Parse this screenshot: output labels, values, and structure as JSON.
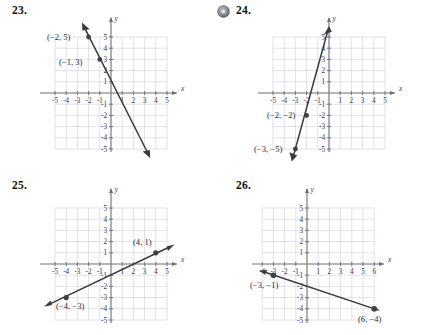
{
  "page": {
    "background_color": "#ffffff",
    "grid_color": "#c9cfdd",
    "axis_color": "#6e6e72",
    "line_color": "#3a3a40"
  },
  "problems": [
    {
      "id": "23",
      "number_label": "23.",
      "has_disc_icon": false,
      "axis": {
        "x_label": "x",
        "y_label": "y",
        "x_ticks": [
          "-5",
          "-4",
          "-3",
          "-2",
          "-1",
          "1",
          "2",
          "3",
          "4",
          "5"
        ],
        "y_ticks": [
          "5",
          "4",
          "3",
          "2",
          "1",
          "-1",
          "-2",
          "-3",
          "-4",
          "-5"
        ],
        "x_min": -5,
        "x_max": 5,
        "y_min": -5,
        "y_max": 5
      },
      "points": [
        {
          "label": "(−2, 5)",
          "x": -2,
          "y": 5
        },
        {
          "label": "(−1, 3)",
          "x": -1,
          "y": 3
        }
      ],
      "line": {
        "from_x": -2.45,
        "from_y": 6.0,
        "to_x": 3.35,
        "to_y": -5.5,
        "slope": -2,
        "intercept": 1
      }
    },
    {
      "id": "24",
      "number_label": "24.",
      "has_disc_icon": true,
      "disc_icon_name": "cd-disc-icon",
      "axis": {
        "x_label": "x",
        "y_label": "y",
        "x_ticks": [
          "-5",
          "-4",
          "-3",
          "-2",
          "-1",
          "1",
          "2",
          "3",
          "4",
          "5"
        ],
        "y_ticks": [
          "5",
          "4",
          "3",
          "2",
          "1",
          "-1",
          "-2",
          "-3",
          "-4",
          "-5"
        ],
        "x_min": -5,
        "x_max": 5,
        "y_min": -5,
        "y_max": 5
      },
      "points": [
        {
          "label": "(−2, −2)",
          "x": -2,
          "y": -2
        },
        {
          "label": "(−3, −5)",
          "x": -3,
          "y": -5
        }
      ],
      "line": {
        "from_x": -3.2,
        "from_y": -5.7,
        "to_x": -0.1,
        "to_y": 5.6,
        "slope": 3,
        "intercept": 4
      }
    },
    {
      "id": "25",
      "number_label": "25.",
      "has_disc_icon": false,
      "axis": {
        "x_label": "x",
        "y_label": "y",
        "x_ticks": [
          "-5",
          "-4",
          "-3",
          "-2",
          "-1",
          "1",
          "2",
          "3",
          "4",
          "5"
        ],
        "y_ticks": [
          "5",
          "4",
          "3",
          "2",
          "1",
          "-1",
          "-2",
          "-3",
          "-4",
          "-5"
        ],
        "x_min": -5,
        "x_max": 5,
        "y_min": -5,
        "y_max": 5
      },
      "points": [
        {
          "label": "(4, 1)",
          "x": 4,
          "y": 1
        },
        {
          "label": "(−4, −3)",
          "x": -4,
          "y": -3
        }
      ],
      "line": {
        "from_x": -5.3,
        "from_y": -3.65,
        "to_x": 5.3,
        "to_y": 1.65,
        "slope": 0.5,
        "intercept": -1
      }
    },
    {
      "id": "26",
      "number_label": "26.",
      "has_disc_icon": false,
      "axis": {
        "x_label": "x",
        "y_label": "y",
        "x_ticks": [
          "-4",
          "-3",
          "-2",
          "-1",
          "1",
          "2",
          "3",
          "4",
          "5",
          "6"
        ],
        "y_ticks": [
          "5",
          "4",
          "3",
          "2",
          "1",
          "-1",
          "-2",
          "-3",
          "-4",
          "-5"
        ],
        "x_min": -4,
        "x_max": 6,
        "y_min": -5,
        "y_max": 5
      },
      "points": [
        {
          "label": "(−3, −1)",
          "x": -3,
          "y": -1
        },
        {
          "label": "(6, −4)",
          "x": 6,
          "y": -4
        }
      ],
      "line": {
        "from_x": -4.0,
        "from_y": -0.67,
        "to_x": 6.35,
        "to_y": -4.12,
        "slope": -0.3333,
        "intercept": -2
      }
    }
  ]
}
